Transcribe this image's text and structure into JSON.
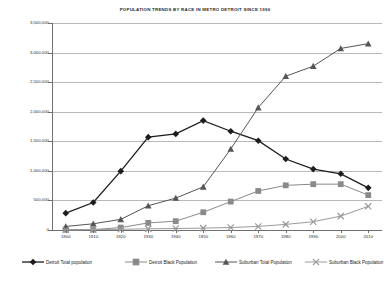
{
  "chart_data": {
    "type": "line",
    "title": "POPULATION TRENDS BY RACE IN METRO DETROIT SINCE 1990",
    "xlabel": "",
    "ylabel": "",
    "categories": [
      "1900",
      "1910",
      "1920",
      "1930",
      "1940",
      "1950",
      "1960",
      "1970",
      "1980",
      "1990",
      "2000",
      "2010"
    ],
    "x": [
      1900,
      1910,
      1920,
      1930,
      1940,
      1950,
      1960,
      1970,
      1980,
      1990,
      2000,
      2010
    ],
    "ylim": [
      0,
      3500000
    ],
    "yticks": [
      0,
      500000,
      1000000,
      1500000,
      2000000,
      2500000,
      3000000,
      3500000
    ],
    "ytick_labels": [
      "0",
      "500,000",
      "1,000,000",
      "1,500,000",
      "2,000,000",
      "2,500,000",
      "3,000,000",
      "3,500,000"
    ],
    "grid": true,
    "legend_position": "bottom",
    "series": [
      {
        "name": "Detroit Total population",
        "marker": "diamond",
        "color": "#1d1d1d",
        "values": [
          285000,
          465000,
          995000,
          1570000,
          1625000,
          1850000,
          1670000,
          1510000,
          1200000,
          1030000,
          950000,
          713000
        ]
      },
      {
        "name": "Detroit Black Population",
        "marker": "square",
        "color": "#8a8a8a",
        "values": [
          4000,
          6000,
          41000,
          120000,
          149000,
          300000,
          480000,
          660000,
          755000,
          775000,
          775000,
          590000
        ]
      },
      {
        "name": "Suburban Total Population",
        "marker": "triangle",
        "color": "#555555",
        "values": [
          60000,
          105000,
          180000,
          410000,
          540000,
          730000,
          1370000,
          2070000,
          2600000,
          2770000,
          3070000,
          3150000
        ]
      },
      {
        "name": "Suburban Black Population",
        "marker": "x",
        "color": "#9a9a9a",
        "values": [
          5000,
          8000,
          12000,
          20000,
          25000,
          32000,
          42000,
          60000,
          95000,
          140000,
          235000,
          400000
        ]
      }
    ]
  }
}
